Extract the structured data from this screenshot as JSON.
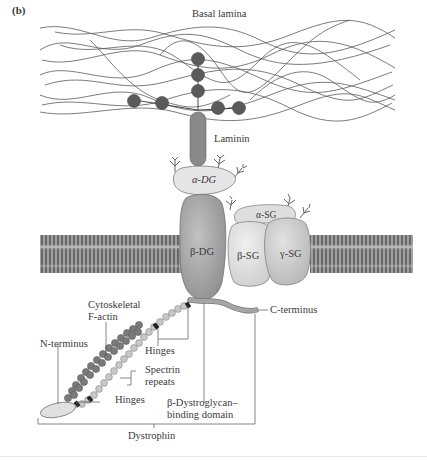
{
  "figure": {
    "panel_label": "(b)",
    "labels": {
      "basal_lamina": "Basal lamina",
      "laminin": "Laminin",
      "alpha_dg": "α-DG",
      "beta_dg": "β-DG",
      "alpha_sg": "α-SG",
      "beta_sg": "β-SG",
      "gamma_sg": "γ-SG",
      "cytoskeletal_line1": "Cytoskeletal",
      "cytoskeletal_line2": "F-actin",
      "n_terminus": "N-terminus",
      "hinges_upper": "Hinges",
      "spectrin_line1": "Spectrin",
      "spectrin_line2": "repeats",
      "hinges_lower": "Hinges",
      "bdg_binding_line1": "β-Dystroglycan–",
      "bdg_binding_line2": "binding domain",
      "c_terminus": "C-terminus",
      "dystrophin": "Dystrophin"
    },
    "colors": {
      "background": "#ffffff",
      "fiber": "#555555",
      "laminin_beads": "#5a5a5a",
      "laminin_stalk": "#8a8a8a",
      "alpha_dg": "#e6e6e6",
      "beta_dg": "#a9a9a9",
      "sarcoglycan_light": "#e2e2e2",
      "sarcoglycan_mid": "#cfcfcf",
      "membrane": "#8c8c8c",
      "actin_beads": "#7a7a7a",
      "spectrin_beads": "#c8c8c8",
      "hinge": "#222222",
      "glycan": "#666666"
    }
  }
}
